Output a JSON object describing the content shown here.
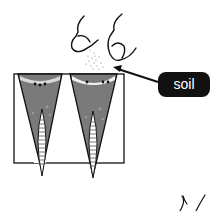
{
  "diagram": {
    "labels": {
      "soil": "soil"
    },
    "colors": {
      "soil_fill": "#7a7a7a",
      "outline": "#111111",
      "label_bg": "#111111",
      "label_text": "#ffffff",
      "background": "#ffffff"
    }
  }
}
